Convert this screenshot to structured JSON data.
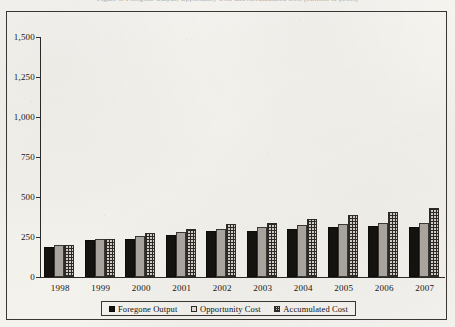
{
  "page": {
    "background_color": "#f4f2ee",
    "clipped_title": "Figure 3. Foregone Output, Opportunity Cost and Accumulated Cost (billions of pesos)"
  },
  "chart_data": {
    "type": "bar",
    "title": "",
    "xlabel": "",
    "ylabel": "",
    "ylim": [
      0,
      1500
    ],
    "ytick_labels": [
      "0",
      "250",
      "500",
      "750",
      "1,000",
      "1,250",
      "1,500"
    ],
    "ytick_values": [
      0,
      250,
      500,
      750,
      1000,
      1250,
      1500
    ],
    "grid": false,
    "legend_position": "bottom",
    "categories": [
      "1998",
      "1999",
      "2000",
      "2001",
      "2002",
      "2003",
      "2004",
      "2005",
      "2006",
      "2007"
    ],
    "series": [
      {
        "name": "Foregone Output",
        "style": "solid-black",
        "color": "#151310",
        "values": [
          185,
          230,
          240,
          265,
          285,
          290,
          300,
          315,
          320,
          315
        ]
      },
      {
        "name": "Opportunity Cost",
        "style": "solid-gray",
        "color": "#a8a39c",
        "values": [
          200,
          235,
          255,
          280,
          300,
          310,
          325,
          330,
          335,
          340
        ]
      },
      {
        "name": "Accumulated Cost",
        "style": "checkered",
        "color": "#cfcac3",
        "values": [
          200,
          240,
          275,
          300,
          330,
          340,
          365,
          385,
          405,
          430
        ]
      }
    ]
  },
  "legend": {
    "items": [
      {
        "label": "Foregone Output",
        "swatch": "solid-black-swatch"
      },
      {
        "label": "Opportunity Cost",
        "swatch": "light-gray-swatch"
      },
      {
        "label": "Accumulated Cost",
        "swatch": "checkered-swatch"
      }
    ]
  }
}
